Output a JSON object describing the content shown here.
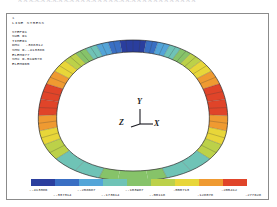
{
  "page": {
    "top_strip_text": "A  A A.A.A A.A.A A.A A A  A.A A  A  A  A.A A.A  A A A A A  A A A  A    A A"
  },
  "plot": {
    "window_number": "1",
    "title": "LINE STRESS",
    "header_lines": [
      "STEP=1",
      "SUB =1",
      "TIME=1"
    ],
    "result_lines": [
      {
        "label": "DMX",
        "value": ".388312"
      },
      {
        "label": "SMN",
        "value": "-.413386"
      },
      {
        "label": "ELEM",
        "value": "77"
      },
      {
        "label": "SMX",
        "value": ".519578"
      },
      {
        "label": "ELEM",
        "value": "65"
      }
    ],
    "axis_triad": {
      "x_label": "X",
      "y_label": "Y",
      "z_label": "Z"
    }
  },
  "legend": {
    "colors": [
      "#2b3f9e",
      "#3a6fc4",
      "#53a5d8",
      "#6fc3b6",
      "#86c36a",
      "#bcd14a",
      "#e8d63a",
      "#ef9a32",
      "#e0452a"
    ],
    "labels_upper": [
      "-.413386",
      "-.258687",
      "-.103987",
      ".050713",
      ".205412"
    ],
    "labels_lower": [
      "-.337314",
      "-.173614",
      "-.00118",
      ".128078",
      ".277628",
      ".519578"
    ]
  },
  "chart_data": {
    "type": "contour",
    "title": "LINE STRESS",
    "value_range": [
      -0.413386,
      0.519578
    ],
    "n_bands": 9,
    "band_boundaries": [
      -0.413386,
      -0.337314,
      -0.258687,
      -0.173614,
      -0.103987,
      -0.00118,
      0.050713,
      0.128078,
      0.205412,
      0.277628,
      0.519578
    ],
    "colorbar_labels_upper": [
      "-.413386",
      "-.258687",
      "-.103987",
      ".050713",
      ".205412"
    ],
    "colorbar_labels_lower": [
      "-.337314",
      "-.173614",
      "-.00118",
      ".128078",
      ".277628",
      ".519578"
    ],
    "annotations": {
      "DMX": ".388312",
      "SMN": "-.413386",
      "SMN_ELEM": "77",
      "SMX": ".519578",
      "SMX_ELEM": "65",
      "STEP": "1",
      "SUB": "1",
      "TIME": "1"
    },
    "regions": [
      {
        "name": "crown-top",
        "angle_deg": 90,
        "color": "#2b3f9e",
        "value": -0.38
      },
      {
        "name": "upper-left",
        "angle_deg": 140,
        "color": "#e0452a",
        "value": 0.45
      },
      {
        "name": "upper-right",
        "angle_deg": 40,
        "color": "#e0452a",
        "value": 0.45
      },
      {
        "name": "lower-left",
        "angle_deg": 215,
        "color": "#6fc3b6",
        "value": -0.02
      },
      {
        "name": "lower-right",
        "angle_deg": 325,
        "color": "#6fc3b6",
        "value": -0.02
      },
      {
        "name": "bottom",
        "angle_deg": 270,
        "color": "#86c36a",
        "value": 0.04
      }
    ],
    "grid": false,
    "legend_position": "bottom"
  }
}
